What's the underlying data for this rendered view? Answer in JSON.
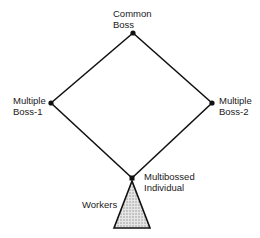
{
  "diagram": {
    "nodes": [
      {
        "id": "common-boss",
        "line1": "Common",
        "line2": "Boss",
        "x": 133,
        "y": 33
      },
      {
        "id": "multiple-boss-1",
        "line1": "Multiple",
        "line2": "Boss-1",
        "x": 51,
        "y": 103
      },
      {
        "id": "multiple-boss-2",
        "line1": "Multiple",
        "line2": "Boss-2",
        "x": 212,
        "y": 103
      },
      {
        "id": "multibossed-individual",
        "line1": "Multibossed",
        "line2": "Individual",
        "x": 132,
        "y": 178
      }
    ],
    "edges": [
      [
        "common-boss",
        "multiple-boss-1"
      ],
      [
        "common-boss",
        "multiple-boss-2"
      ],
      [
        "multiple-boss-1",
        "multibossed-individual"
      ],
      [
        "multiple-boss-2",
        "multibossed-individual"
      ]
    ],
    "workers": {
      "label": "Workers"
    },
    "colors": {
      "line": "#111111",
      "fill": "#c8c8c8"
    }
  }
}
